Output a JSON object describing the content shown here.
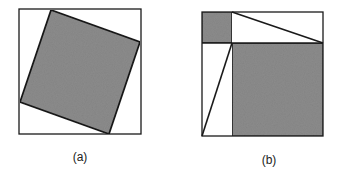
{
  "figure": {
    "colors": {
      "stroke": "#1a1a1a",
      "shade": "#8c8c8c",
      "background": "#ffffff"
    },
    "panels": [
      {
        "id": "a",
        "label": "(a)",
        "outer_square": {
          "x": 19,
          "y": 9,
          "w": 122,
          "h": 125
        },
        "inner_rotated_square": [
          [
            51,
            10
          ],
          [
            140,
            42
          ],
          [
            109,
            134
          ],
          [
            20,
            102
          ]
        ]
      },
      {
        "id": "b",
        "label": "(b)",
        "outer_square": {
          "x": 202,
          "y": 12,
          "w": 121,
          "h": 124
        },
        "small_shaded_square": {
          "x": 202,
          "y": 12,
          "w": 30,
          "h": 31
        },
        "large_shaded_square": {
          "x": 232,
          "y": 43,
          "w": 91,
          "h": 93
        },
        "diagonals": [
          [
            [
              232,
              12
            ],
            [
              323,
              43
            ]
          ],
          [
            [
              202,
              136
            ],
            [
              232,
              43
            ]
          ]
        ]
      }
    ]
  }
}
